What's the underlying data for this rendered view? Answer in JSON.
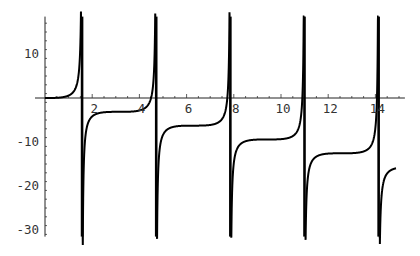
{
  "chart_data": {
    "type": "line",
    "title": "",
    "xlabel": "",
    "ylabel": "",
    "function": "tan(x) - x",
    "xlim": [
      0,
      15.25
    ],
    "ylim": [
      -31.5,
      18.5
    ],
    "curve_x_range": [
      0,
      14.87
    ],
    "asymptotes": [
      1.5708,
      4.7124,
      7.854,
      10.9956,
      14.1372
    ],
    "x_ticks": [
      2,
      4,
      6,
      8,
      10,
      12,
      14
    ],
    "x_tick_labels": [
      "2",
      "4",
      "6",
      "8",
      "10",
      "12",
      "14"
    ],
    "y_ticks": [
      10,
      -10,
      -20,
      -30
    ],
    "y_tick_labels": [
      "10",
      "-10",
      "-20",
      "-30"
    ],
    "grid": false,
    "legend": null,
    "series": [
      {
        "name": "tan(x) - x",
        "color": "#000000",
        "sample_points": [
          [
            0,
            0
          ],
          [
            1,
            0.557
          ],
          [
            1.4,
            4.398
          ],
          [
            1.5,
            12.6
          ],
          [
            1.65,
            -14.27
          ],
          [
            2,
            -4.185
          ],
          [
            3.1416,
            -3.1416
          ],
          [
            4,
            -2.842
          ],
          [
            4.6,
            -0.74
          ],
          [
            4.75,
            -31.5
          ],
          [
            5,
            -8.381
          ],
          [
            6.2832,
            -6.2832
          ],
          [
            7,
            -6.129
          ],
          [
            7.7,
            1.0
          ],
          [
            7.95,
            -18.4
          ],
          [
            9.4248,
            -9.4248
          ],
          [
            10.8,
            4.26
          ],
          [
            11.1,
            -20.6
          ],
          [
            12.5664,
            -12.5664
          ],
          [
            14,
            -6.8
          ],
          [
            14.2,
            -30.1
          ],
          [
            14.87,
            -16.0
          ]
        ]
      }
    ]
  }
}
